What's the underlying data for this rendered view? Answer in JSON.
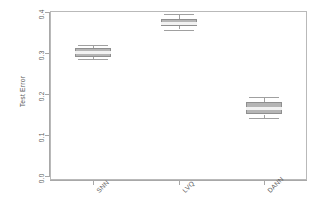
{
  "chart_data": {
    "type": "box",
    "title": "",
    "xlabel": "",
    "ylabel": "Test Error",
    "ylim": [
      0.0,
      0.4
    ],
    "yticks": [
      0.0,
      0.1,
      0.2,
      0.3,
      0.4
    ],
    "ytick_labels": [
      "0.0",
      "0.1",
      "0.2",
      "0.3",
      "0.4"
    ],
    "categories": [
      "SNN",
      "LVQ",
      "DANN"
    ],
    "grid": false,
    "legend": null,
    "box_fill_color": "#b5b5b5",
    "box_border_color": "#8f8f8f",
    "median_color": "#f2f2f2",
    "axis_color": "#a8a8a8",
    "boxes": [
      {
        "label": "SNN",
        "whisker_low": 0.285,
        "q1": 0.29,
        "median": 0.303,
        "q3": 0.313,
        "whisker_high": 0.32,
        "outliers": []
      },
      {
        "label": "LVQ",
        "whisker_low": 0.357,
        "q1": 0.365,
        "median": 0.374,
        "q3": 0.383,
        "whisker_high": 0.395,
        "outliers": []
      },
      {
        "label": "DANN",
        "whisker_low": 0.142,
        "q1": 0.15,
        "median": 0.166,
        "q3": 0.18,
        "whisker_high": 0.193,
        "outliers": []
      }
    ]
  }
}
